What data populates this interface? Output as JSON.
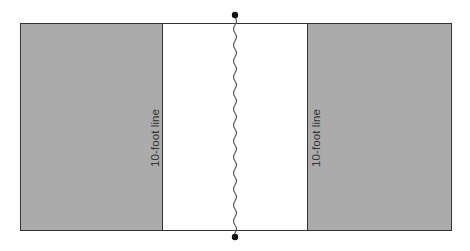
{
  "diagram": {
    "type": "court-zones",
    "left_zone": {
      "label": "10-foot line",
      "fill": "#ababab"
    },
    "center_zone": {
      "fill": "#ffffff"
    },
    "right_zone": {
      "label": "10-foot line",
      "fill": "#ababab"
    },
    "center_line": {
      "style": "wavy",
      "endpoints": "dots",
      "color": "#555555"
    },
    "border_color": "#333333"
  }
}
